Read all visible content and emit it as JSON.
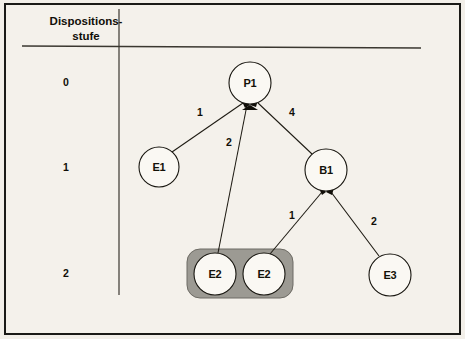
{
  "figure": {
    "header_line1": "Dispositions-",
    "header_line2": "stufe",
    "level_labels": [
      "0",
      "1",
      "2"
    ]
  },
  "nodes": [
    {
      "id": "p1",
      "label": "P1",
      "level": 0,
      "cx": 250,
      "cy": 83,
      "r": 21,
      "highlighted": false
    },
    {
      "id": "e1",
      "label": "E1",
      "level": 1,
      "cx": 159,
      "cy": 167,
      "r": 20,
      "highlighted": false
    },
    {
      "id": "b1",
      "label": "B1",
      "level": 1,
      "cx": 326,
      "cy": 170,
      "r": 21,
      "highlighted": false
    },
    {
      "id": "e2a",
      "label": "E2",
      "level": 2,
      "cx": 215,
      "cy": 274,
      "r": 21,
      "highlighted": true
    },
    {
      "id": "e2b",
      "label": "E2",
      "level": 2,
      "cx": 264,
      "cy": 274,
      "r": 21,
      "highlighted": true
    },
    {
      "id": "e3",
      "label": "E3",
      "level": 2,
      "cx": 390,
      "cy": 275,
      "r": 21,
      "highlighted": false
    }
  ],
  "edges": [
    {
      "from": "e1",
      "to": "p1",
      "quantity": "1",
      "label_x": 200,
      "label_y": 113
    },
    {
      "from": "e2a",
      "to": "p1",
      "quantity": "2",
      "label_x": 229,
      "label_y": 143
    },
    {
      "from": "b1",
      "to": "p1",
      "quantity": "4",
      "label_x": 292,
      "label_y": 113
    },
    {
      "from": "e2b",
      "to": "b1",
      "quantity": "1",
      "label_x": 292,
      "label_y": 216
    },
    {
      "from": "e3",
      "to": "b1",
      "quantity": "2",
      "label_x": 374,
      "label_y": 222
    }
  ],
  "highlight_group": {
    "label": "e2-group-highlight",
    "x": 187,
    "y": 249,
    "width": 106,
    "height": 49,
    "radius": 13
  },
  "colors": {
    "paper": "#f4f1eb",
    "frame": "#1a1a17",
    "ink": "#100e08",
    "highlight_fill": "#9c9a93",
    "node_fill": "#faf8f3"
  }
}
